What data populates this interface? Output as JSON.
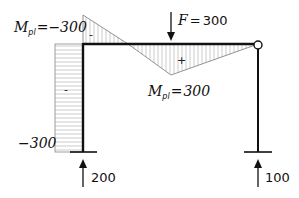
{
  "diagram": {
    "type": "frame-bending-moment",
    "load": {
      "symbol": "F",
      "equals": "=",
      "value": "300"
    },
    "moment_left": {
      "symbol": "M",
      "subscript": "pl",
      "equals": "=",
      "value": "−300"
    },
    "moment_mid": {
      "symbol": "M",
      "subscript": "pl",
      "equals": "=",
      "value": "300"
    },
    "column_moment_label": "−300",
    "signs": {
      "left_triangle": "-",
      "beam_positive": "+",
      "column": "-"
    },
    "reactions": {
      "left": "200",
      "right": "100"
    },
    "colors": {
      "structure": "#111111",
      "hatch": "#9a9a9a"
    }
  }
}
